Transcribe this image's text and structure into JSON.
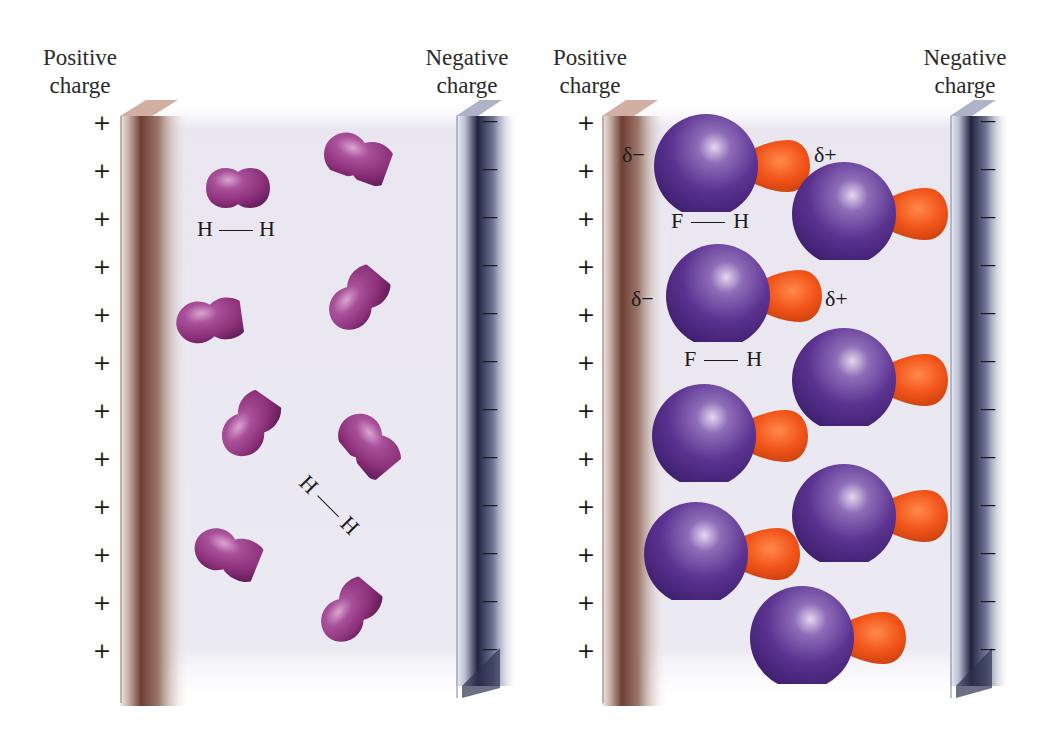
{
  "panels": [
    {
      "id": "nonpolar",
      "positive_label": [
        "Positive",
        "charge"
      ],
      "negative_label": [
        "Negative",
        "charge"
      ],
      "molecule": "H2",
      "bond_labels": [
        {
          "left": "H",
          "bond": "—",
          "right": "H"
        },
        {
          "left": "H",
          "bond": "—",
          "right": "H"
        }
      ],
      "plus_count": 12,
      "minus_count": 12
    },
    {
      "id": "polar",
      "positive_label": [
        "Positive",
        "charge"
      ],
      "negative_label": [
        "Negative",
        "charge"
      ],
      "molecule": "HF",
      "bond_labels": [
        {
          "left": "F",
          "bond": "—",
          "right": "H"
        },
        {
          "left": "F",
          "bond": "—",
          "right": "H"
        }
      ],
      "partial_charges": [
        {
          "neg": "δ−",
          "pos": "δ+"
        },
        {
          "neg": "δ−",
          "pos": "δ+"
        }
      ],
      "plus_count": 12,
      "minus_count": 12
    }
  ],
  "symbols": {
    "plus": "+",
    "minus": "—"
  },
  "colors": {
    "positive_plate": "#8a5a4a",
    "negative_plate": "#2e3350",
    "h2_molecule": "#9a3f86",
    "fluorine_atom": "#5b2f8c",
    "hydrogen_atom": "#f25a1a",
    "field_background": "#e9e6f0"
  }
}
